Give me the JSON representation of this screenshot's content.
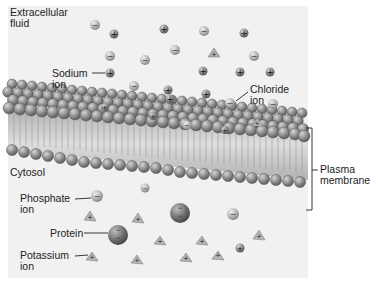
{
  "labels": {
    "extracellular_fluid": "Extracellular\nfluid",
    "sodium_ion": "Sodium\nion",
    "chloride_ion": "Chloride\nion",
    "cytosol": "Cytosol",
    "plasma_membrane": "Plasma\nmembrane",
    "phosphate_ion": "Phosphate\nion",
    "protein": "Protein",
    "potassium_ion": "Potassium\nion"
  },
  "symbols": {
    "positive": "+",
    "negative": "−"
  },
  "colors": {
    "background_panel": "#f1f1f1",
    "head_dark": "#6f6f6f",
    "head_light": "#b5b5b5",
    "tail": "#c8c8c8",
    "text": "#222222"
  },
  "icons": {
    "sodium": "round-ion-positive-icon",
    "chloride": "round-ion-negative-icon",
    "phosphate": "round-ion-negative-icon",
    "potassium": "pyramid-ion-positive-icon",
    "protein": "large-sphere-negative-icon"
  }
}
